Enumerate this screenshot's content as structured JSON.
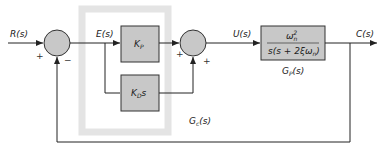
{
  "diagram": {
    "type": "block-diagram",
    "colors": {
      "block_fill": "#c8c8c8",
      "block_stroke": "#333333",
      "controller_region": "#e6e6e6",
      "line": "#222222"
    },
    "signals": {
      "input": "R(s)",
      "error": "E(s)",
      "control": "U(s)",
      "output": "C(s)"
    },
    "summing_junction_1": {
      "plus": "+",
      "minus": "−"
    },
    "summing_junction_2": {
      "plus_left": "+",
      "plus_bottom": "+"
    },
    "blocks": {
      "kp": {
        "main": "K",
        "sub": "P"
      },
      "kd": {
        "main": "K",
        "sub": "D",
        "suffix": "s"
      },
      "plant": {
        "numerator_main": "ω",
        "numerator_sub": "n",
        "numerator_sup": "2",
        "denominator": "s(s + 2ξω",
        "denominator_sub": "n",
        "denominator_end": ")"
      }
    },
    "region_labels": {
      "controller": "G",
      "controller_sub": "c",
      "controller_arg": "(s)",
      "plant": "G",
      "plant_sub": "P",
      "plant_arg": "(s)"
    }
  }
}
